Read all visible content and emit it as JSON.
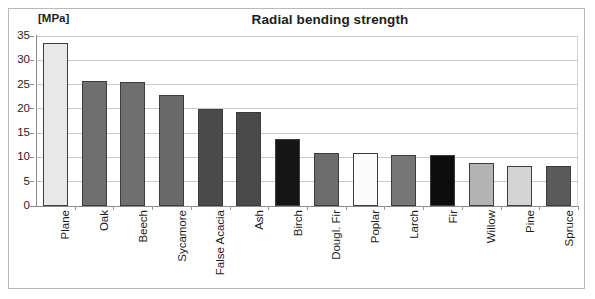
{
  "chart_data": {
    "type": "bar",
    "title": "Radial bending strength",
    "xlabel": "",
    "ylabel": "[MPa]",
    "yunit": "[MPa]",
    "ylim": [
      0,
      35
    ],
    "yticks": [
      0,
      5,
      10,
      15,
      20,
      25,
      30,
      35
    ],
    "ytick_labels": [
      "0",
      "5",
      "10",
      "15",
      "20",
      "25",
      "30",
      "35"
    ],
    "grid": true,
    "legend": "none",
    "categories": [
      "Plane",
      "Oak",
      "Beech",
      "Sycamore",
      "False Acacia",
      "Ash",
      "Birch",
      "Dougl. Fir",
      "Poplar",
      "Larch",
      "Fir",
      "Willow",
      "Pine",
      "Spruce"
    ],
    "values": [
      33.6,
      25.8,
      25.5,
      22.9,
      20.0,
      19.4,
      13.8,
      11.0,
      11.0,
      10.5,
      10.5,
      8.9,
      8.3,
      8.2
    ],
    "bar_colors": [
      "#e8e8e8",
      "#6f6f6f",
      "#6f6f6f",
      "#6a6a6a",
      "#4a4a4a",
      "#4a4a4a",
      "#161616",
      "#6c6c6c",
      "#fbfbfb",
      "#767676",
      "#0d0d0d",
      "#b3b3b3",
      "#d4d4d4",
      "#5a5a5a"
    ],
    "bar_edge_color": "#3c3c3c"
  },
  "figure": {
    "frame_color": "#b9b9b9",
    "grid_color": "#c9c9c9",
    "axis_color": "#8a8a8a",
    "background": "#ffffff",
    "text_color": "#1d1d1d"
  }
}
